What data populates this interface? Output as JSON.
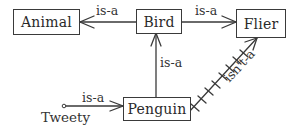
{
  "diagram": {
    "type": "semantic-network",
    "nodes": [
      {
        "id": "animal",
        "label": "Animal"
      },
      {
        "id": "bird",
        "label": "Bird"
      },
      {
        "id": "flier",
        "label": "Flier"
      },
      {
        "id": "penguin",
        "label": "Penguin"
      },
      {
        "id": "tweety",
        "label": "Tweety"
      }
    ],
    "edges": [
      {
        "from": "bird",
        "to": "animal",
        "label": "is-a",
        "style": "solid"
      },
      {
        "from": "bird",
        "to": "flier",
        "label": "is-a",
        "style": "solid"
      },
      {
        "from": "penguin",
        "to": "bird",
        "label": "is-a",
        "style": "solid"
      },
      {
        "from": "tweety",
        "to": "penguin",
        "label": "is-a",
        "style": "solid"
      },
      {
        "from": "penguin",
        "to": "flier",
        "label": "isn't-a",
        "style": "crossed-ticks"
      }
    ]
  },
  "colors": {
    "line": "#3a3a3a",
    "text": "#2a2a2a",
    "background": "#ffffff"
  }
}
